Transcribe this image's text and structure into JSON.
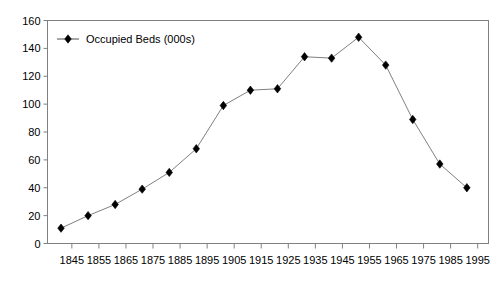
{
  "chart_data": {
    "type": "line",
    "title": "",
    "subtitle": "",
    "xlabel": "",
    "ylabel": "",
    "grid": false,
    "legend_position": "top-left",
    "legend": [
      "Occupied Beds (000s)"
    ],
    "series": [
      {
        "name": "Occupied Beds (000s)",
        "marker": "diamond",
        "color": "#000000",
        "line_color": "#808080",
        "x": [
          1841,
          1851,
          1861,
          1871,
          1881,
          1891,
          1901,
          1911,
          1921,
          1931,
          1941,
          1951,
          1961,
          1971,
          1981,
          1991
        ],
        "values": [
          11,
          20,
          28,
          39,
          51,
          68,
          99,
          110,
          111,
          134,
          133,
          148,
          128,
          89,
          57,
          40
        ]
      }
    ],
    "xlim": [
      1836,
      1999
    ],
    "ylim": [
      0,
      160
    ],
    "ytick_values": [
      0,
      20,
      40,
      60,
      80,
      100,
      120,
      140,
      160
    ],
    "ytick_labels": [
      "0",
      "20",
      "40",
      "60",
      "80",
      "100",
      "120",
      "140",
      "160"
    ],
    "xtick_values": [
      1845,
      1855,
      1865,
      1875,
      1885,
      1895,
      1905,
      1915,
      1925,
      1935,
      1945,
      1955,
      1965,
      1975,
      1985,
      1995
    ],
    "xtick_labels": [
      "1845",
      "1855",
      "1865",
      "1875",
      "1885",
      "1895",
      "1905",
      "1915",
      "1925",
      "1935",
      "1945",
      "1955",
      "1965",
      "1975",
      "1985",
      "1995"
    ]
  },
  "style": {
    "plot_border_color": "#808080",
    "axis_color": "#808080",
    "tick_color": "#808080",
    "background": "#ffffff",
    "marker_color": "#000000",
    "line_color": "#808080"
  }
}
